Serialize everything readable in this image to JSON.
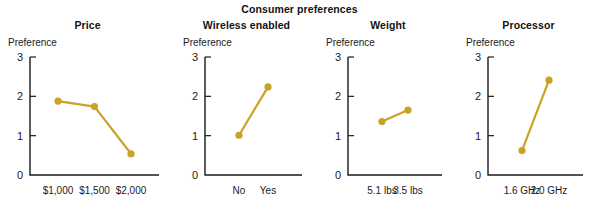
{
  "figure": {
    "title": "Consumer preferences",
    "axis_color": "#1a1a1a",
    "series_color": "#c9a227",
    "background": "#ffffff"
  },
  "chart_data": [
    {
      "type": "line",
      "title": "Price",
      "xlabel": "",
      "ylabel": "Preference",
      "categories": [
        "$1,000",
        "$1,500",
        "$2,000"
      ],
      "values": [
        1.88,
        1.74,
        0.54
      ],
      "ylim": [
        0,
        3
      ],
      "yticks": [
        "0",
        "1",
        "2",
        "3"
      ],
      "grid": false,
      "legend": "none",
      "marker": "circle"
    },
    {
      "type": "line",
      "title": "Wireless enabled",
      "xlabel": "",
      "ylabel": "Preference",
      "categories": [
        "No",
        "Yes"
      ],
      "values": [
        1.01,
        2.24
      ],
      "ylim": [
        0,
        3
      ],
      "yticks": [
        "0",
        "1",
        "2",
        "3"
      ],
      "grid": false,
      "legend": "none",
      "marker": "circle"
    },
    {
      "type": "line",
      "title": "Weight",
      "xlabel": "",
      "ylabel": "Preference",
      "categories": [
        "5.1 lbs",
        "3.5 lbs"
      ],
      "values": [
        1.36,
        1.65
      ],
      "ylim": [
        0,
        3
      ],
      "yticks": [
        "0",
        "1",
        "2",
        "3"
      ],
      "grid": false,
      "legend": "none",
      "marker": "circle"
    },
    {
      "type": "line",
      "title": "Processor",
      "xlabel": "",
      "ylabel": "Preference",
      "categories": [
        "1.6 GHz",
        "2.0 GHz"
      ],
      "values": [
        0.62,
        2.41
      ],
      "ylim": [
        0,
        3
      ],
      "yticks": [
        "0",
        "1",
        "2",
        "3"
      ],
      "grid": false,
      "legend": "none",
      "marker": "circle"
    }
  ]
}
